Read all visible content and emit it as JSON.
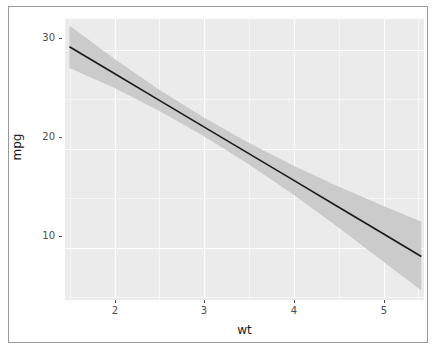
{
  "figure": {
    "background_color": "#ffffff",
    "panel_color": "#ebebeb",
    "gridline_color": "#ffffff",
    "border_color": "#9a9a9a"
  },
  "axes": {
    "x": {
      "label": "wt",
      "ticks": [
        {
          "value": 2,
          "label": "2"
        },
        {
          "value": 3,
          "label": "3"
        },
        {
          "value": 4,
          "label": "4"
        },
        {
          "value": 5,
          "label": "5"
        }
      ]
    },
    "y": {
      "label": "mpg",
      "ticks": [
        {
          "value": 10,
          "label": "10"
        },
        {
          "value": 20,
          "label": "20"
        },
        {
          "value": 30,
          "label": "30"
        }
      ]
    }
  },
  "chart_data": {
    "type": "line",
    "title": "",
    "subtitle": "",
    "xlabel": "wt",
    "ylabel": "mpg",
    "xlim": [
      1.45,
      5.48
    ],
    "ylim": [
      3.6,
      32.0
    ],
    "xticks": [
      2,
      3,
      4,
      5
    ],
    "yticks": [
      10,
      20,
      30
    ],
    "grid": true,
    "legend": "none",
    "series": [
      {
        "name": "linear fit (mpg ~ wt)",
        "type": "line",
        "color": "#1a1a1a",
        "width": 1.6,
        "x": [
          1.5,
          2.0,
          2.5,
          3.0,
          3.5,
          4.0,
          4.5,
          5.0,
          5.45
        ],
        "y": [
          29.2,
          26.52,
          23.83,
          21.15,
          18.47,
          15.79,
          13.1,
          10.42,
          8.0
        ]
      },
      {
        "name": "95% confidence ribbon",
        "type": "area",
        "color": "#c9c9c9",
        "x": [
          1.5,
          2.0,
          2.5,
          3.0,
          3.5,
          4.0,
          4.5,
          5.0,
          5.45
        ],
        "y_low": [
          27.05,
          25.05,
          22.75,
          20.2,
          17.4,
          14.35,
          11.05,
          7.65,
          4.55
        ],
        "y_high": [
          31.35,
          28.0,
          24.9,
          22.1,
          19.55,
          17.25,
          15.15,
          13.2,
          11.5
        ]
      }
    ],
    "annotations": []
  }
}
